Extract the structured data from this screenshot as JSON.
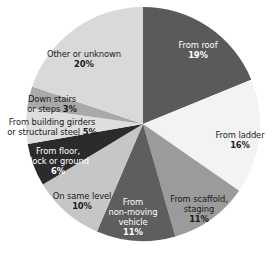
{
  "chart_data": {
    "type": "pie",
    "title": "",
    "start_angle_deg": 0,
    "direction": "clockwise",
    "center": [
      143,
      124
    ],
    "radius": 117,
    "slices": [
      {
        "name": "From roof",
        "value": 19,
        "label_lines": [
          "From roof"
        ],
        "pct_label": "19%",
        "pct_inline": false,
        "color": "#5a5a5a",
        "text_color": "#ffffff",
        "label_pos": [
          198,
          50
        ]
      },
      {
        "name": "From ladder",
        "value": 16,
        "label_lines": [
          "From ladder"
        ],
        "pct_label": "16%",
        "pct_inline": false,
        "color": "#f3f3f3",
        "text_color": "#222222",
        "label_pos": [
          240,
          140
        ]
      },
      {
        "name": "From scaffold, staging",
        "value": 11,
        "label_lines": [
          "From scaffold,",
          "staging"
        ],
        "pct_label": "11%",
        "pct_inline": false,
        "color": "#9b9b9b",
        "text_color": "#1a1a1a",
        "label_pos": [
          199,
          209
        ]
      },
      {
        "name": "From non-moving vehicle",
        "value": 11,
        "label_lines": [
          "From",
          "non-moving",
          "vehicle"
        ],
        "pct_label": "11%",
        "pct_inline": false,
        "color": "#5e5e5e",
        "text_color": "#ffffff",
        "label_pos": [
          133,
          217
        ]
      },
      {
        "name": "On same level",
        "value": 10,
        "label_lines": [
          "On same level"
        ],
        "pct_label": "10%",
        "pct_inline": false,
        "color": "#c6c6c6",
        "text_color": "#1a1a1a",
        "label_pos": [
          82,
          201
        ]
      },
      {
        "name": "From floor, dock or ground",
        "value": 6,
        "label_lines": [
          "From floor,",
          "dock or ground"
        ],
        "pct_label": "6%",
        "pct_inline": false,
        "color": "#2b2b2b",
        "text_color": "#ffffff",
        "label_pos": [
          58,
          161
        ]
      },
      {
        "name": "From building girders or structural steel",
        "value": 5,
        "label_lines": [
          "From building girders",
          "or structural steel"
        ],
        "pct_label": "5%",
        "pct_inline": true,
        "color": "#dedede",
        "text_color": "#1a1a1a",
        "label_pos": [
          52,
          127
        ]
      },
      {
        "name": "Down stairs or steps",
        "value": 3,
        "label_lines": [
          "Down stairs",
          "or steps"
        ],
        "pct_label": "3%",
        "pct_inline": true,
        "color": "#a9a9a9",
        "text_color": "#1a1a1a",
        "label_pos": [
          52,
          104
        ]
      },
      {
        "name": "Other or unknown",
        "value": 20,
        "label_lines": [
          "Other or unknown"
        ],
        "pct_label": "20%",
        "pct_inline": false,
        "color": "#d9d9d9",
        "text_color": "#1a1a1a",
        "label_pos": [
          84,
          59
        ]
      }
    ],
    "categories": [
      "From roof",
      "From ladder",
      "From scaffold, staging",
      "From non-moving vehicle",
      "On same level",
      "From floor, dock or ground",
      "From building girders or structural steel",
      "Down stairs or steps",
      "Other or unknown"
    ],
    "values": [
      19,
      16,
      11,
      11,
      10,
      6,
      5,
      3,
      20
    ],
    "unit": "%",
    "legend": "none (labels on slices)"
  }
}
